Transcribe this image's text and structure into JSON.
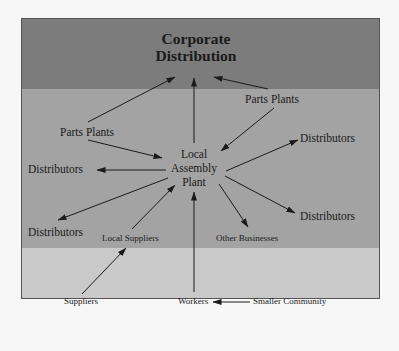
{
  "colors": {
    "band_top": "#7c7c7c",
    "band_mid": "#a3a3a3",
    "band_bot": "#c9c9c9",
    "arrow": "#1a1a1a",
    "background": "#f7f7f7"
  },
  "diagram": {
    "title_line1": "Corporate",
    "title_line2": "Distribution",
    "hub_line1": "Local",
    "hub_line2": "Assembly",
    "hub_line3": "Plant",
    "nodes": {
      "parts_plants_left": "Parts Plants",
      "parts_plants_right": "Parts Plants",
      "distributors_left": "Distributors",
      "distributors_right_top": "Distributors",
      "distributors_left_bottom": "Distributors",
      "distributors_right_bottom": "Distributors",
      "local_suppliers": "Local Suppliers",
      "other_businesses": "Other Businesses",
      "suppliers": "Suppliers",
      "workers": "Workers",
      "smaller_community": "Smaller Community"
    },
    "edges": [
      {
        "from": "Parts Plants (left)",
        "to": "Corporate Distribution"
      },
      {
        "from": "Local Assembly Plant",
        "to": "Corporate Distribution"
      },
      {
        "from": "Parts Plants (right)",
        "to": "Corporate Distribution"
      },
      {
        "from": "Parts Plants (left)",
        "to": "Local Assembly Plant"
      },
      {
        "from": "Parts Plants (right)",
        "to": "Local Assembly Plant"
      },
      {
        "from": "Local Assembly Plant",
        "to": "Distributors (left)"
      },
      {
        "from": "Local Assembly Plant",
        "to": "Distributors (right top)"
      },
      {
        "from": "Local Assembly Plant",
        "to": "Distributors (left bottom)"
      },
      {
        "from": "Local Assembly Plant",
        "to": "Distributors (right bottom)"
      },
      {
        "from": "Local Assembly Plant",
        "to": "Other Businesses"
      },
      {
        "from": "Local Suppliers",
        "to": "Local Assembly Plant"
      },
      {
        "from": "Suppliers",
        "to": "Local Suppliers"
      },
      {
        "from": "Workers",
        "to": "Local Assembly Plant"
      },
      {
        "from": "Smaller Community",
        "to": "Workers"
      }
    ]
  }
}
